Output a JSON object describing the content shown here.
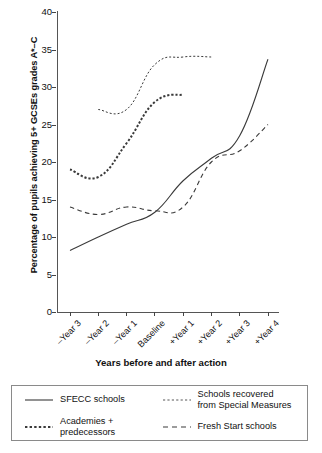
{
  "chart_data": {
    "type": "line",
    "title": "",
    "xlabel": "Years before and after action",
    "ylabel": "Percentage of pupils achieving 5+ GCSEs grades A*–C",
    "categories": [
      "–Year 3",
      "–Year 2",
      "–Year 1",
      "Baseline",
      "+Year 1",
      "+Year 2",
      "+Year 3",
      "+Year 4"
    ],
    "ylim": [
      0,
      40
    ],
    "yticks": [
      0,
      5,
      10,
      15,
      20,
      25,
      30,
      35,
      40
    ],
    "grid": false,
    "legend_position": "below-plot-boxed",
    "series": [
      {
        "name": "SFECC schools",
        "style": "solid",
        "x": [
          "–Year 3",
          "–Year 2",
          "–Year 1",
          "Baseline",
          "+Year 1",
          "+Year 2",
          "+Year 3",
          "+Year 4"
        ],
        "values": [
          8.2,
          10.0,
          11.7,
          13.3,
          17.5,
          20.5,
          23.5,
          33.7
        ]
      },
      {
        "name": "Academies + predecessors",
        "style": "dotted-thick",
        "x": [
          "–Year 3",
          "–Year 2",
          "–Year 1",
          "Baseline",
          "+Year 1"
        ],
        "values": [
          19.0,
          18.0,
          22.5,
          28.0,
          29.0
        ]
      },
      {
        "name": "Schools recovered from Special Measures",
        "style": "dotted-fine",
        "x": [
          "–Year 2",
          "–Year 1",
          "Baseline",
          "+Year 1",
          "+Year 2"
        ],
        "values": [
          27.0,
          27.0,
          33.0,
          34.0,
          34.0
        ]
      },
      {
        "name": "Fresh Start schools",
        "style": "dashed",
        "x": [
          "–Year 3",
          "–Year 2",
          "–Year 1",
          "Baseline",
          "+Year 1",
          "+Year 2",
          "+Year 3",
          "+Year 4"
        ],
        "values": [
          14.0,
          13.0,
          14.0,
          13.5,
          14.0,
          20.0,
          21.5,
          25.0
        ]
      }
    ]
  },
  "axes": {
    "y_title": "Percentage of pupils achieving 5+ GCSEs grades A*–C",
    "x_title": "Years before and after action",
    "y_tick_labels": [
      "0",
      "5",
      "10",
      "15",
      "20",
      "25",
      "30",
      "35",
      "40"
    ],
    "x_tick_labels": [
      "–Year 3",
      "–Year 2",
      "–Year 1",
      "Baseline",
      "+Year 1",
      "+Year 2",
      "+Year 3",
      "+Year 4"
    ]
  },
  "legend": {
    "entries": [
      {
        "label": "SFECC schools",
        "style": "solid"
      },
      {
        "label_line1": "Schools recovered",
        "label_line2": "from Special Measures",
        "style": "dotted-fine"
      },
      {
        "label": "Academies + predecessors",
        "style": "dotted-thick"
      },
      {
        "label": "Fresh Start schools",
        "style": "dashed"
      }
    ]
  },
  "colors": {
    "line": "#3a3a3a",
    "axis": "#555555",
    "text": "#111111",
    "legend_border": "#8a8a8a",
    "background": "#ffffff"
  }
}
